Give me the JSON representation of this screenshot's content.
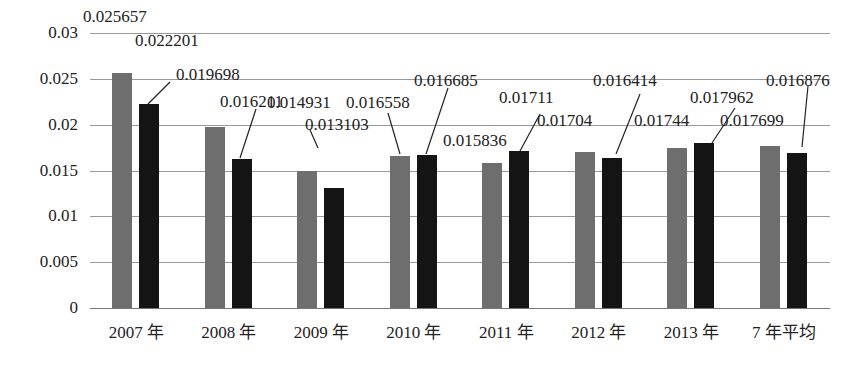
{
  "chart_data": {
    "type": "bar",
    "title": "",
    "xlabel": "",
    "ylabel": "",
    "ylim": [
      0,
      0.03
    ],
    "yticks": [
      "0",
      "0.005",
      "0.01",
      "0.015",
      "0.02",
      "0.025",
      "0.03"
    ],
    "grid": true,
    "legend": null,
    "categories": [
      "2007 年",
      "2008 年",
      "2009 年",
      "2010 年",
      "2011 年",
      "2012 年",
      "2013 年",
      "7 年平均"
    ],
    "series": [
      {
        "name": "series-gray",
        "color": "#6e6e6e",
        "values": [
          0.025657,
          0.019698,
          0.014931,
          0.016558,
          0.015836,
          0.01704,
          0.01744,
          0.017699
        ],
        "labels": [
          "0.025657",
          "0.019698",
          "0.014931",
          "0.016558",
          "0.015836",
          "0.01704",
          "0.01744",
          "0.017699"
        ]
      },
      {
        "name": "series-black",
        "color": "#141414",
        "values": [
          0.022201,
          0.016211,
          0.013103,
          0.016685,
          0.01711,
          0.016414,
          0.017962,
          0.016876
        ],
        "labels": [
          "0.022201",
          "0.016211",
          "0.013103",
          "0.016685",
          "0.01711",
          "0.016414",
          "0.017962",
          "0.016876"
        ]
      }
    ]
  }
}
